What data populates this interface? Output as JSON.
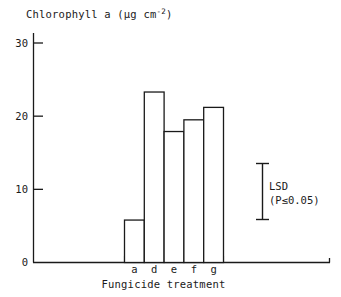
{
  "chart_data": {
    "type": "bar",
    "title": "",
    "ylabel": "Chlorophyll a (µg cm⁻²)",
    "ylabel_parts": {
      "main": "Chlorophyll a (µg cm",
      "exponent": "-2",
      "tail": ")"
    },
    "xlabel": "Fungicide treatment",
    "categories": [
      "a",
      "d",
      "e",
      "f",
      "g"
    ],
    "values": [
      5.8,
      23.3,
      17.9,
      19.5,
      21.2
    ],
    "series": [
      {
        "name": "Chlorophyll a",
        "values": [
          5.8,
          23.3,
          17.9,
          19.5,
          21.2
        ]
      }
    ],
    "ylim": [
      0,
      31
    ],
    "yticks": [
      0,
      10,
      20,
      30
    ],
    "ytick_labels": [
      "0",
      "10",
      "20",
      "30"
    ],
    "grid": false,
    "legend": "none",
    "bar_style": {
      "fill": "#ffffff",
      "edge": "#1a1a1a",
      "edge_width": 1.3
    },
    "annotations": [
      {
        "name": "lsd-error-bar",
        "type": "error-bar",
        "label_line1": "LSD",
        "label_line2": "(P≤0.05)",
        "value_span": 7.8
      }
    ]
  },
  "colors": {
    "ink": "#1a1a1a",
    "paper": "#ffffff"
  }
}
